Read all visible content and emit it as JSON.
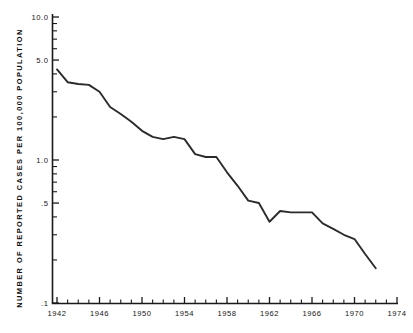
{
  "chart_data": {
    "type": "line",
    "title": "",
    "xlabel": "",
    "ylabel": "NUMBER OF REPORTED CASES PER 100,000 POPULATION",
    "yscale": "log",
    "ylim": [
      0.1,
      10.0
    ],
    "xlim": [
      1941,
      1974
    ],
    "grid": false,
    "legend": null,
    "y_tick_labels": [
      "10.0",
      "5.0",
      "1.0",
      ".5",
      ".1"
    ],
    "y_tick_values": [
      10.0,
      5.0,
      1.0,
      0.5,
      0.1
    ],
    "y_minor_ticks": [
      9,
      8,
      7,
      6,
      4,
      3,
      2,
      0.9,
      0.8,
      0.7,
      0.6,
      0.4,
      0.3,
      0.2
    ],
    "x_tick_labels": [
      "1942",
      "1946",
      "1950",
      "1954",
      "1958",
      "1962",
      "1966",
      "1970",
      "1974"
    ],
    "x_tick_values": [
      1942,
      1946,
      1950,
      1954,
      1958,
      1962,
      1966,
      1970,
      1974
    ],
    "x_minor_step": 1,
    "line_color": "#2b2b2b",
    "x": [
      1942,
      1943,
      1944,
      1945,
      1946,
      1947,
      1948,
      1949,
      1950,
      1951,
      1952,
      1953,
      1954,
      1955,
      1956,
      1957,
      1958,
      1959,
      1960,
      1961,
      1962,
      1963,
      1964,
      1965,
      1966,
      1967,
      1968,
      1969,
      1970,
      1971,
      1972
    ],
    "values": [
      4.3,
      3.5,
      3.4,
      3.35,
      3.0,
      2.35,
      2.1,
      1.85,
      1.6,
      1.45,
      1.4,
      1.45,
      1.4,
      1.1,
      1.05,
      1.05,
      0.82,
      0.66,
      0.52,
      0.5,
      0.37,
      0.44,
      0.43,
      0.43,
      0.43,
      0.36,
      0.33,
      0.3,
      0.28,
      0.22,
      0.175
    ]
  },
  "axis": {
    "y_title": "NUMBER OF REPORTED CASES PER 100,000 POPULATION"
  }
}
